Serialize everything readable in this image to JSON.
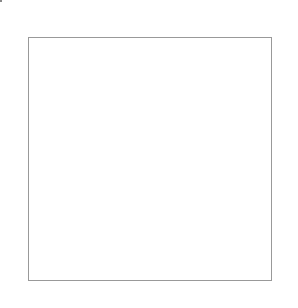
{
  "columns": [
    "15",
    "14",
    "13",
    "12",
    "11",
    "10",
    "9",
    "8",
    "7",
    "6",
    "5",
    "4",
    "3",
    "2",
    "1"
  ],
  "rows_left": [
    "18",
    "16",
    "14",
    "12",
    "10",
    "8",
    "6",
    "4",
    "2"
  ],
  "rows_right": [
    "17",
    "15",
    "13",
    "11",
    "9",
    "7",
    "5",
    "3",
    "1"
  ],
  "colors": {
    "filled": "#555555",
    "empty": "#ffffff",
    "gridline": "#d0d0d0"
  },
  "pattern": [
    "000001000100000",
    "000010000010000",
    "000100000001000",
    "111000010000111",
    "101000111000101",
    "111000010000111",
    "000100000001000",
    "000010000010000",
    "000001000100000",
    "000000111000000",
    "000000101000000",
    "000000111000000",
    "000001000100000",
    "000010000010000",
    "000100000001000",
    "111000010000111",
    "101000111000101",
    "111000010000111"
  ],
  "outline": {
    "from_col": "12",
    "to_col": "1",
    "from_row": "9",
    "to_row": "1"
  }
}
